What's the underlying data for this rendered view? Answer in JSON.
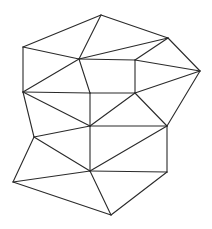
{
  "diagram": {
    "type": "triangulated-mesh",
    "width": 212,
    "height": 229,
    "stroke_color": "#2a2a2a",
    "background": "#ffffff",
    "vertices": {
      "A": [
        101,
        15
      ],
      "B": [
        168,
        38
      ],
      "C": [
        200,
        71
      ],
      "D": [
        23,
        47
      ],
      "E": [
        79,
        59
      ],
      "F": [
        135,
        60
      ],
      "G": [
        23,
        92
      ],
      "H": [
        90,
        93
      ],
      "I": [
        135,
        93
      ],
      "J": [
        90,
        126
      ],
      "K": [
        167,
        126
      ],
      "L": [
        34,
        137
      ],
      "M": [
        90,
        171
      ],
      "N": [
        167,
        172
      ],
      "O": [
        13,
        182
      ],
      "P": [
        111,
        215
      ]
    },
    "edges": [
      [
        "D",
        "A"
      ],
      [
        "A",
        "B"
      ],
      [
        "B",
        "C"
      ],
      [
        "A",
        "E"
      ],
      [
        "D",
        "E"
      ],
      [
        "E",
        "B"
      ],
      [
        "B",
        "F"
      ],
      [
        "F",
        "C"
      ],
      [
        "D",
        "G"
      ],
      [
        "E",
        "G"
      ],
      [
        "E",
        "H"
      ],
      [
        "E",
        "F"
      ],
      [
        "F",
        "I"
      ],
      [
        "G",
        "H"
      ],
      [
        "H",
        "I"
      ],
      [
        "I",
        "C"
      ],
      [
        "G",
        "J"
      ],
      [
        "G",
        "L"
      ],
      [
        "H",
        "J"
      ],
      [
        "I",
        "J"
      ],
      [
        "I",
        "K"
      ],
      [
        "C",
        "K"
      ],
      [
        "L",
        "J"
      ],
      [
        "J",
        "K"
      ],
      [
        "J",
        "M"
      ],
      [
        "K",
        "M"
      ],
      [
        "K",
        "N"
      ],
      [
        "L",
        "M"
      ],
      [
        "L",
        "O"
      ],
      [
        "O",
        "M"
      ],
      [
        "M",
        "N"
      ],
      [
        "O",
        "P"
      ],
      [
        "M",
        "P"
      ],
      [
        "N",
        "P"
      ]
    ]
  }
}
